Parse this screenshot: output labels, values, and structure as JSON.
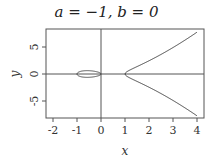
{
  "chart_data": {
    "type": "line",
    "title": "a = −1, b = 0",
    "xlabel": "x",
    "ylabel": "y",
    "equation": "y^2 = x^3 + a*x + b",
    "params": {
      "a": -1,
      "b": 0
    },
    "xlim": [
      -2.3,
      4.3
    ],
    "ylim": [
      -8.2,
      8.2
    ],
    "x_ticks": [
      -2,
      -1,
      0,
      1,
      2,
      3,
      4
    ],
    "y_ticks": [
      -5,
      0,
      5
    ],
    "grid": false,
    "reference_lines": {
      "x": 0,
      "y": 0
    },
    "series": [
      {
        "name": "oval",
        "description": "closed loop between x=-1 and x=0",
        "x": [
          -1,
          -0.9,
          -0.75,
          -0.577,
          -0.4,
          -0.25,
          -0.1,
          0
        ],
        "y_pos": [
          0,
          0.41,
          0.57,
          0.62,
          0.58,
          0.48,
          0.31,
          0
        ]
      },
      {
        "name": "right-branch",
        "description": "unbounded branch from x=1",
        "x": [
          1,
          1.2,
          1.5,
          2,
          2.5,
          3,
          3.5,
          4
        ],
        "y_pos": [
          0,
          0.86,
          1.57,
          2.45,
          3.62,
          4.9,
          6.27,
          7.75
        ]
      }
    ]
  },
  "title": "a = −1, b = 0",
  "axes": {
    "xlabel": "x",
    "ylabel": "y",
    "x_tick_labels": [
      "-2",
      "-1",
      "0",
      "1",
      "2",
      "3",
      "4"
    ],
    "y_tick_labels": [
      "5",
      "0",
      "-5"
    ]
  }
}
